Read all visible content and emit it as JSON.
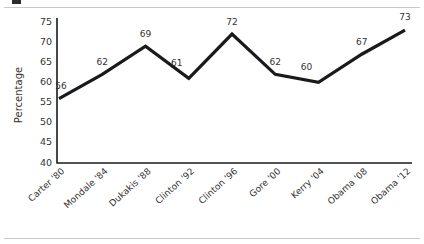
{
  "figure": {
    "background": "#ffffff",
    "rule_color": "#c9c9c9",
    "ink_color": "#1a1a1a",
    "text_color": "#333333"
  },
  "chart_data": {
    "type": "line",
    "title": "",
    "xlabel": "",
    "ylabel": "Percentage",
    "categories": [
      "Carter '80",
      "Mondale '84",
      "Dukakis '88",
      "Clinton '92",
      "Clinton '96",
      "Gore '00",
      "Kerry '04",
      "Obama '08",
      "Obama '12"
    ],
    "values": [
      56,
      62,
      69,
      61,
      72,
      62,
      60,
      67,
      73
    ],
    "point_labels": [
      "56",
      "62",
      "69",
      "61",
      "72",
      "62",
      "60",
      "67",
      "73"
    ],
    "ylim": [
      40,
      75
    ],
    "yticks": [
      40,
      45,
      50,
      55,
      60,
      65,
      70,
      75
    ],
    "ytick_labels": [
      "40",
      "45",
      "50",
      "55",
      "60",
      "65",
      "70",
      "75"
    ],
    "grid": false,
    "legend": false,
    "legend_position": "none",
    "line_color": "#1a1a1a",
    "markers": false
  }
}
